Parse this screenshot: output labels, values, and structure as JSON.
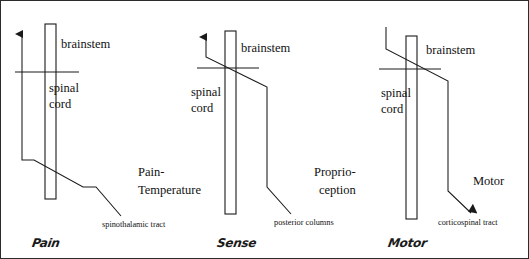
{
  "figure": {
    "border_color": "#2b2b2b",
    "line_color": "#1a1a1a",
    "background": "#ffffff"
  },
  "panels": [
    {
      "id": "pain",
      "region_upper": "brainstem",
      "region_lower_line1": "spinal",
      "region_lower_line2": "cord",
      "modality_line1": "Pain-",
      "modality_line2": "Temperature",
      "tract_caption": "spinothalamic tract",
      "handwritten_label": "Pain",
      "crossing_level": "spinal cord",
      "direction": "ascending"
    },
    {
      "id": "sense",
      "region_upper": "brainstem",
      "region_lower_line1": "spinal",
      "region_lower_line2": "cord",
      "modality_line1": "Proprio-",
      "modality_line2": "ception",
      "tract_caption": "posterior columns",
      "handwritten_label": "Sense",
      "crossing_level": "brainstem",
      "direction": "ascending"
    },
    {
      "id": "motor",
      "region_upper": "brainstem",
      "region_lower_line1": "spinal",
      "region_lower_line2": "cord",
      "modality_line1": "Motor",
      "modality_line2": "",
      "tract_caption": "corticospinal tract",
      "handwritten_label": "Motor",
      "crossing_level": "brainstem",
      "direction": "descending"
    }
  ]
}
